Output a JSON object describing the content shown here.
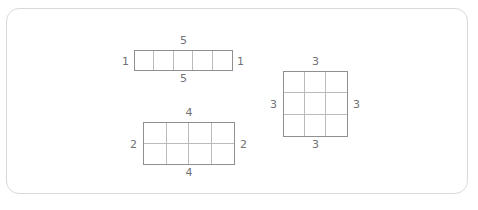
{
  "canvas": {
    "background": "#ffffff",
    "border_color": "#d9d9d9",
    "line_color": "#8f8f8f",
    "inner_line_color": "#b9bcbe",
    "label_color": "#6f7276"
  },
  "caption": {
    "text": ""
  },
  "chart_data": {
    "type": "diagram",
    "title": "",
    "figures": [
      {
        "name": "strip",
        "rows": 1,
        "columns": 5,
        "cell_count": 5,
        "labels": {
          "top": "5",
          "bottom": "5",
          "left": "1",
          "right": "1"
        }
      },
      {
        "name": "rectangle",
        "rows": 2,
        "columns": 4,
        "cell_count": 8,
        "labels": {
          "top": "4",
          "bottom": "4",
          "left": "2",
          "right": "2"
        }
      },
      {
        "name": "square",
        "rows": 3,
        "columns": 3,
        "cell_count": 9,
        "labels": {
          "top": "3",
          "bottom": "3",
          "left": "3",
          "right": "3"
        }
      }
    ]
  }
}
